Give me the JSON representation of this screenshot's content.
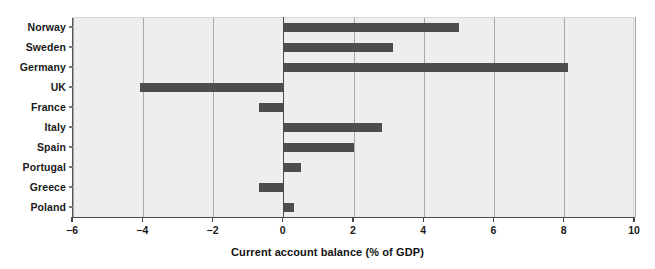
{
  "chart_data": {
    "type": "bar",
    "orientation": "horizontal",
    "title": "",
    "subtitle": "",
    "xlabel": "Current account balance (% of GDP)",
    "ylabel": "",
    "categories": [
      "Norway",
      "Sweden",
      "Germany",
      "UK",
      "France",
      "Italy",
      "Spain",
      "Portugal",
      "Greece",
      "Poland"
    ],
    "values": [
      5.0,
      3.1,
      8.1,
      -4.1,
      -0.7,
      2.8,
      2.0,
      0.5,
      -0.7,
      0.3
    ],
    "series": [
      {
        "name": "Current account balance (% of GDP)",
        "values": [
          5.0,
          3.1,
          8.1,
          -4.1,
          -0.7,
          2.8,
          2.0,
          0.5,
          -0.7,
          0.3
        ]
      }
    ],
    "xlim": [
      -6,
      10
    ],
    "xticks": [
      -6,
      -4,
      -2,
      0,
      2,
      4,
      6,
      8,
      10
    ],
    "xtick_labels": [
      "−6",
      "−4",
      "−2",
      "0",
      "2",
      "4",
      "6",
      "8",
      "10"
    ],
    "grid": "vertical",
    "legend": "none",
    "bar_color": "#4d4d4d",
    "plot_background": "#eeeeee",
    "gridline_color": "#a8a8a8",
    "zero_line_color": "#4a4a4a",
    "annotations": []
  },
  "axis": {
    "x_title": "Current account balance (% of GDP)"
  }
}
